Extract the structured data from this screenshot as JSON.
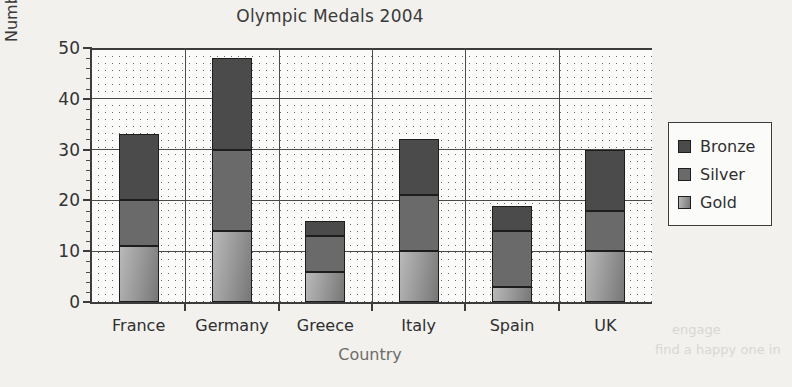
{
  "chart_data": {
    "type": "bar",
    "subtype": "stacked-vertical",
    "title": "Olympic Medals 2004",
    "xlabel": "Country",
    "ylabel": "Number of medals",
    "categories": [
      "France",
      "Germany",
      "Greece",
      "Italy",
      "Spain",
      "UK"
    ],
    "series": [
      {
        "name": "Gold",
        "values": [
          11,
          14,
          6,
          10,
          3,
          10
        ],
        "color": "#a0a0a0"
      },
      {
        "name": "Silver",
        "values": [
          9,
          16,
          7,
          11,
          11,
          8
        ],
        "color": "#6a6a6a"
      },
      {
        "name": "Bronze",
        "values": [
          13,
          18,
          3,
          11,
          5,
          12
        ],
        "color": "#4b4b4b"
      }
    ],
    "cumulative_tops": {
      "Gold": [
        11,
        14,
        6,
        10,
        3,
        10
      ],
      "Silver": [
        20,
        30,
        13,
        21,
        14,
        18
      ],
      "Bronze": [
        33,
        48,
        16,
        32,
        19,
        30
      ]
    },
    "totals": [
      33,
      48,
      16,
      32,
      19,
      30
    ],
    "ylim": [
      0,
      50
    ],
    "ymajor_ticks": [
      0,
      10,
      20,
      30,
      40,
      50
    ],
    "ytick_labels": [
      "0",
      "10",
      "20",
      "30",
      "40",
      "50"
    ],
    "yminor_tick_step": 2,
    "grid": "major horizontal and category vertical, dotted panel fill",
    "legend_position": "right-outside",
    "legend_entries": [
      "Bronze",
      "Silver",
      "Gold"
    ]
  },
  "legend": {
    "entries": [
      {
        "label": "Bronze",
        "swatch_class": "seg-bronze"
      },
      {
        "label": "Silver",
        "swatch_class": "seg-silver"
      },
      {
        "label": "Gold",
        "swatch_class": "seg-gold"
      }
    ]
  },
  "colors": {
    "bronze": "#4b4b4b",
    "silver": "#6a6a6a",
    "gold": "#a0a0a0",
    "axis": "#3c3c3c",
    "panel_background": "#fbfbfa",
    "page_background": "#f2f1ee"
  }
}
